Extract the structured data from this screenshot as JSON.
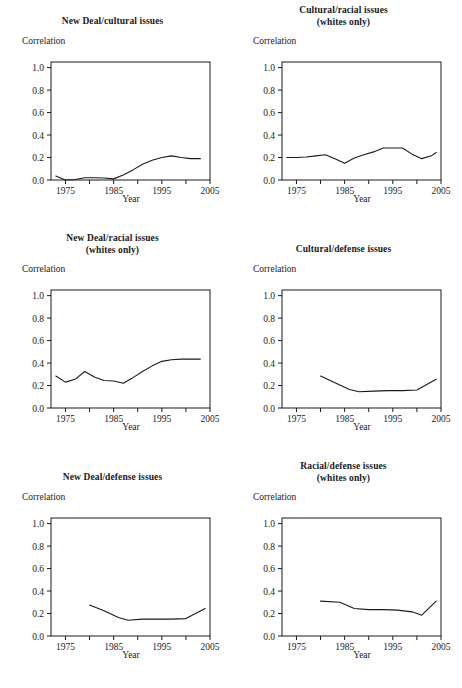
{
  "figure": {
    "axis_common": {
      "ylabel": "Correlation",
      "xlabel": "Year",
      "ytick_labels": [
        "1.0",
        "0.8",
        "0.6",
        "0.4",
        "0.2",
        "0.0"
      ],
      "ytick_values": [
        1.0,
        0.8,
        0.6,
        0.4,
        0.2,
        0.0
      ],
      "xtick_labels": [
        "1975",
        "1985",
        "1995",
        "2005"
      ],
      "xtick_values": [
        1975,
        1985,
        1995,
        2005
      ],
      "xminor_values": [
        1980,
        1990,
        2000
      ],
      "xlim": [
        1972,
        2005
      ],
      "ylim": [
        0.0,
        1.05
      ],
      "line_color": "#1a1a1a",
      "grid": false,
      "legend": "none"
    },
    "source_note": ""
  },
  "chart_data": [
    {
      "type": "line",
      "title": "New Deal/cultural issues",
      "subtitle": "",
      "xlabel": "Year",
      "ylabel": "Correlation",
      "xlim": [
        1972,
        2005
      ],
      "ylim": [
        0.0,
        1.05
      ],
      "x": [
        1973,
        1975,
        1977,
        1979,
        1981,
        1983,
        1985,
        1987,
        1989,
        1991,
        1993,
        1995,
        1997,
        1999,
        2001,
        2003
      ],
      "values": [
        0.035,
        0.0,
        0.005,
        0.02,
        0.02,
        0.018,
        0.01,
        0.045,
        0.09,
        0.14,
        0.175,
        0.2,
        0.215,
        0.2,
        0.19,
        0.19
      ]
    },
    {
      "type": "line",
      "title": "Cultural/racial issues",
      "subtitle": "(whites only)",
      "xlabel": "Year",
      "ylabel": "Correlation",
      "xlim": [
        1972,
        2005
      ],
      "ylim": [
        0.0,
        1.05
      ],
      "x": [
        1973,
        1975,
        1977,
        1979,
        1981,
        1983,
        1985,
        1987,
        1989,
        1991,
        1993,
        1995,
        1997,
        1999,
        2001,
        2003,
        2004
      ],
      "values": [
        0.2,
        0.2,
        0.205,
        0.215,
        0.225,
        0.19,
        0.15,
        0.195,
        0.225,
        0.25,
        0.285,
        0.285,
        0.285,
        0.23,
        0.19,
        0.215,
        0.245
      ]
    },
    {
      "type": "line",
      "title": "New Deal/racial issues",
      "subtitle": "(whites only)",
      "xlabel": "Year",
      "ylabel": "Correlation",
      "xlim": [
        1972,
        2005
      ],
      "ylim": [
        0.0,
        1.05
      ],
      "x": [
        1973,
        1975,
        1977,
        1979,
        1981,
        1983,
        1985,
        1987,
        1989,
        1991,
        1993,
        1995,
        1997,
        1999,
        2001,
        2003
      ],
      "values": [
        0.285,
        0.23,
        0.255,
        0.325,
        0.275,
        0.245,
        0.24,
        0.22,
        0.27,
        0.325,
        0.375,
        0.415,
        0.43,
        0.435,
        0.435,
        0.435
      ]
    },
    {
      "type": "line",
      "title": "Cultural/defense issues",
      "subtitle": "",
      "xlabel": "Year",
      "ylabel": "Correlation",
      "xlim": [
        1972,
        2005
      ],
      "ylim": [
        0.0,
        1.05
      ],
      "x": [
        1980,
        1983,
        1986,
        1988,
        1991,
        1994,
        1997,
        2000,
        2004
      ],
      "values": [
        0.285,
        0.225,
        0.165,
        0.145,
        0.15,
        0.155,
        0.155,
        0.16,
        0.255
      ]
    },
    {
      "type": "line",
      "title": "New Deal/defense issues",
      "subtitle": "",
      "xlabel": "Year",
      "ylabel": "Correlation",
      "xlim": [
        1972,
        2005
      ],
      "ylim": [
        0.0,
        1.05
      ],
      "x": [
        1980,
        1983,
        1986,
        1988,
        1991,
        1994,
        1997,
        2000,
        2004
      ],
      "values": [
        0.275,
        0.225,
        0.165,
        0.14,
        0.15,
        0.15,
        0.15,
        0.155,
        0.245
      ]
    },
    {
      "type": "line",
      "title": "Racial/defense issues",
      "subtitle": "(whites only)",
      "xlabel": "Year",
      "ylabel": "Correlation",
      "xlim": [
        1972,
        2005
      ],
      "ylim": [
        0.0,
        1.05
      ],
      "x": [
        1980,
        1984,
        1987,
        1990,
        1993,
        1996,
        1999,
        2001,
        2004
      ],
      "values": [
        0.31,
        0.3,
        0.245,
        0.235,
        0.235,
        0.23,
        0.215,
        0.185,
        0.31
      ]
    }
  ]
}
